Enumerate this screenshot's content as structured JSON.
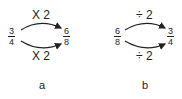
{
  "panels": [
    {
      "id": "a",
      "label": "a",
      "start_fraction": {
        "numerator": "3",
        "denominator": "4"
      },
      "end_fraction": {
        "numerator": "6",
        "denominator": "8"
      },
      "top_operation": "X 2",
      "bottom_operation": "X 2"
    },
    {
      "id": "b",
      "label": "b",
      "start_fraction": {
        "numerator": "6",
        "denominator": "8"
      },
      "end_fraction": {
        "numerator": "3",
        "denominator": "4"
      },
      "top_operation": "÷ 2",
      "bottom_operation": "÷ 2"
    }
  ],
  "colors": {
    "ink": "#222222",
    "background": "#ffffff"
  }
}
